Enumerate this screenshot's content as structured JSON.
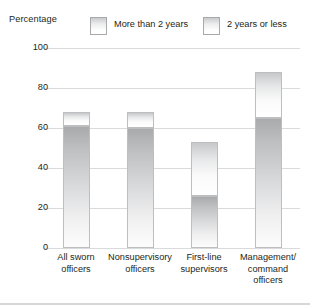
{
  "axis_title": "Percentage",
  "legend": [
    {
      "name": "more-than-2-years",
      "label": "More than 2 years"
    },
    {
      "name": "2-years-or-less",
      "label": "2 years or less"
    }
  ],
  "chart_data": {
    "type": "bar",
    "stacked": true,
    "title": "",
    "subtitle": "",
    "xlabel": "",
    "ylabel": "Percentage",
    "ylim": [
      0,
      100
    ],
    "yticks": [
      0,
      20,
      40,
      60,
      80,
      100
    ],
    "ytick_labels": [
      "0",
      "20",
      "40",
      "60",
      "80",
      "100"
    ],
    "grid": true,
    "legend_position": "top",
    "categories": [
      "All sworn officers",
      "Nonsupervisory officers",
      "First-line supervisors",
      "Management/ command officers"
    ],
    "category_lines": [
      [
        "All sworn",
        "officers"
      ],
      [
        "Nonsupervisory",
        "officers"
      ],
      [
        "First-line",
        "supervisors"
      ],
      [
        "Management/",
        "command",
        "officers"
      ]
    ],
    "series": [
      {
        "name": "2 years or less",
        "values": [
          61,
          60,
          26,
          65
        ]
      },
      {
        "name": "More than 2 years",
        "values": [
          7,
          8,
          27,
          23
        ]
      }
    ],
    "totals": [
      68,
      68,
      53,
      88
    ]
  },
  "colors": {
    "gridline": "#d9dadb",
    "bar_border": "#bcbec0",
    "text": "#231f20",
    "background": "#ffffff"
  }
}
